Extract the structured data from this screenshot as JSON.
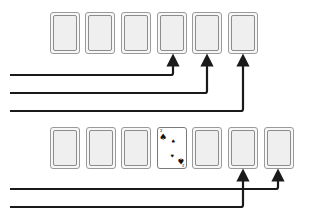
{
  "diagram": {
    "title": "",
    "rows": [
      {
        "name": "top-row",
        "cards": [
          {
            "state": "face-down"
          },
          {
            "state": "face-down"
          },
          {
            "state": "face-down"
          },
          {
            "state": "face-down"
          },
          {
            "state": "face-down"
          },
          {
            "state": "face-down"
          }
        ],
        "arrows_to_card_index": [
          3,
          4,
          5
        ]
      },
      {
        "name": "bottom-row",
        "cards": [
          {
            "state": "face-down"
          },
          {
            "state": "face-down"
          },
          {
            "state": "face-down"
          },
          {
            "state": "face-up",
            "rank": "2",
            "suit": "spades",
            "suit_glyph": "♠",
            "corner_top": "2",
            "corner_bottom": "2"
          },
          {
            "state": "face-down"
          },
          {
            "state": "face-down"
          },
          {
            "state": "face-down"
          }
        ],
        "arrows_to_card_index": [
          5,
          6
        ]
      }
    ],
    "colors": {
      "line": "#1a1a1a",
      "card_border": "#9a9a9a",
      "card_fill": "#efefef"
    }
  }
}
